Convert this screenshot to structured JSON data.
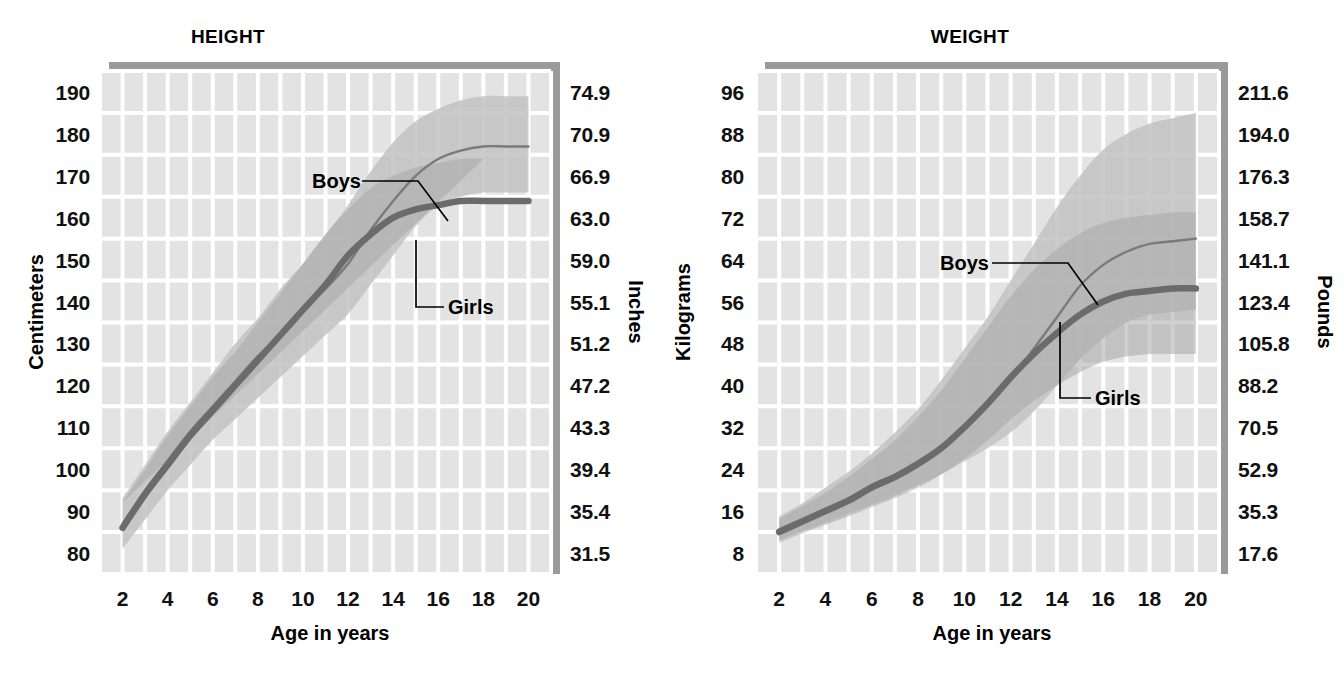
{
  "figure": {
    "panels": [
      "HEIGHT",
      "WEIGHT"
    ]
  },
  "height_panel": {
    "title": "HEIGHT",
    "y_left_title": "Centimeters",
    "y_right_title": "Inches",
    "x_title": "Age in years",
    "boys_label": "Boys",
    "girls_label": "Girls"
  },
  "weight_panel": {
    "title": "WEIGHT",
    "y_left_title": "Kilograms",
    "y_right_title": "Pounds",
    "x_title": "Age in years",
    "boys_label": "Boys",
    "girls_label": "Girls"
  },
  "colors": {
    "plot_background": "#e3e3e3",
    "gridline": "#ffffff",
    "band_boys": "#c2c2c2",
    "band_girls": "#a8a8a8",
    "line_boys": "#7a7a7a",
    "line_girls": "#6b6b6b",
    "shadow": "#9a9a9a",
    "text": "#111111"
  },
  "chart_data": [
    {
      "type": "line",
      "title": "HEIGHT",
      "xlabel": "Age in years",
      "ylabel": "Centimeters",
      "ylabel_right": "Inches",
      "xlim": [
        1,
        21
      ],
      "ylim": [
        75,
        195
      ],
      "grid": true,
      "legend": "inline-annotations",
      "x": [
        2,
        3,
        4,
        5,
        6,
        7,
        8,
        9,
        10,
        11,
        12,
        13,
        14,
        15,
        16,
        17,
        18,
        19,
        20
      ],
      "xticks": [
        2,
        4,
        6,
        8,
        10,
        12,
        14,
        16,
        18,
        20
      ],
      "yticks_left": [
        190,
        180,
        170,
        160,
        150,
        140,
        130,
        120,
        110,
        100,
        90,
        80
      ],
      "yticks_right": [
        "74.9",
        "70.9",
        "66.9",
        "63.0",
        "59.0",
        "55.1",
        "51.2",
        "47.2",
        "43.3",
        "39.4",
        "35.4",
        "31.5"
      ],
      "series": [
        {
          "name": "Boys",
          "values": [
            87,
            95,
            102,
            109,
            115,
            121,
            127,
            132,
            138,
            143,
            149,
            157,
            164,
            170,
            174,
            176,
            177,
            177,
            177
          ],
          "band_low": [
            81,
            88,
            95,
            101,
            107,
            112,
            117,
            122,
            127,
            132,
            137,
            144,
            151,
            158,
            163,
            165,
            166,
            166,
            166
          ],
          "band_high": [
            93,
            101,
            109,
            116,
            123,
            130,
            136,
            143,
            149,
            156,
            163,
            171,
            178,
            183,
            186,
            188,
            189,
            189,
            189
          ]
        },
        {
          "name": "Girls",
          "values": [
            86,
            94,
            101,
            108,
            114,
            120,
            126,
            132,
            138,
            144,
            151,
            156,
            160,
            162,
            163,
            164,
            164,
            164,
            164
          ],
          "band_low": [
            80,
            87,
            94,
            100,
            106,
            111,
            116,
            122,
            127,
            133,
            139,
            144,
            148,
            150,
            151,
            152,
            152,
            152,
            152
          ],
          "band_high": [
            92,
            100,
            108,
            115,
            122,
            128,
            135,
            142,
            149,
            156,
            162,
            167,
            170,
            172,
            173,
            174,
            174,
            174
          ]
        }
      ]
    },
    {
      "type": "line",
      "title": "WEIGHT",
      "xlabel": "Age in years",
      "ylabel": "Kilograms",
      "ylabel_right": "Pounds",
      "xlim": [
        1,
        21
      ],
      "ylim": [
        4,
        100
      ],
      "grid": true,
      "legend": "inline-annotations",
      "x": [
        2,
        3,
        4,
        5,
        6,
        7,
        8,
        9,
        10,
        11,
        12,
        13,
        14,
        15,
        16,
        17,
        18,
        19,
        20
      ],
      "xticks": [
        2,
        4,
        6,
        8,
        10,
        12,
        14,
        16,
        18,
        20
      ],
      "yticks_left": [
        96,
        88,
        80,
        72,
        64,
        56,
        48,
        40,
        32,
        24,
        16,
        8
      ],
      "yticks_right": [
        "211.6",
        "194.0",
        "176.3",
        "158.7",
        "141.1",
        "123.4",
        "105.8",
        "88.2",
        "70.5",
        "52.9",
        "35.3",
        "17.6"
      ],
      "series": [
        {
          "name": "Boys",
          "values": [
            12.5,
            14.5,
            16.5,
            18.5,
            21,
            23,
            25.5,
            28.5,
            32,
            36,
            41,
            47,
            53,
            59,
            63,
            65.5,
            67,
            67.5,
            68
          ],
          "band_low": [
            10.5,
            12.2,
            13.8,
            15.5,
            17.2,
            19,
            21,
            23,
            25.5,
            28,
            31,
            35,
            40,
            45,
            49,
            52,
            53.5,
            54,
            54.5
          ],
          "band_high": [
            15,
            17.5,
            20.5,
            23.5,
            27,
            31,
            35.5,
            41,
            47,
            53,
            60,
            67,
            74,
            80,
            85,
            88,
            90,
            91,
            92
          ]
        },
        {
          "name": "Girls",
          "values": [
            12,
            14,
            16,
            18,
            20.5,
            22.5,
            25,
            28,
            32,
            36.5,
            41.5,
            46,
            50,
            53.5,
            56,
            57.5,
            58,
            58.5,
            58.5
          ],
          "band_low": [
            10,
            11.8,
            13.4,
            15,
            16.8,
            18.5,
            20.5,
            23,
            26,
            29.5,
            33.5,
            37,
            40,
            42.5,
            44.5,
            45.5,
            46,
            46,
            46
          ],
          "band_high": [
            14.5,
            17,
            19.5,
            22.5,
            26,
            29.5,
            34,
            39,
            45,
            51,
            57,
            62,
            66,
            69,
            71,
            72,
            72.5,
            73,
            73
          ]
        }
      ]
    }
  ]
}
